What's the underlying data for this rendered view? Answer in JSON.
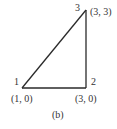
{
  "diagram": {
    "type": "triangle-element",
    "caption": "(b)",
    "nodes": [
      {
        "id": "1",
        "label": "1",
        "coords": "(1, 0)"
      },
      {
        "id": "2",
        "label": "2",
        "coords": "(3, 0)"
      },
      {
        "id": "3",
        "label": "3",
        "coords": "(3, 3)"
      }
    ],
    "edges": [
      [
        "1",
        "2"
      ],
      [
        "2",
        "3"
      ],
      [
        "3",
        "1"
      ]
    ],
    "colors": {
      "stroke": "#2a2a2a",
      "text": "#333333",
      "background": "#ffffff"
    }
  }
}
